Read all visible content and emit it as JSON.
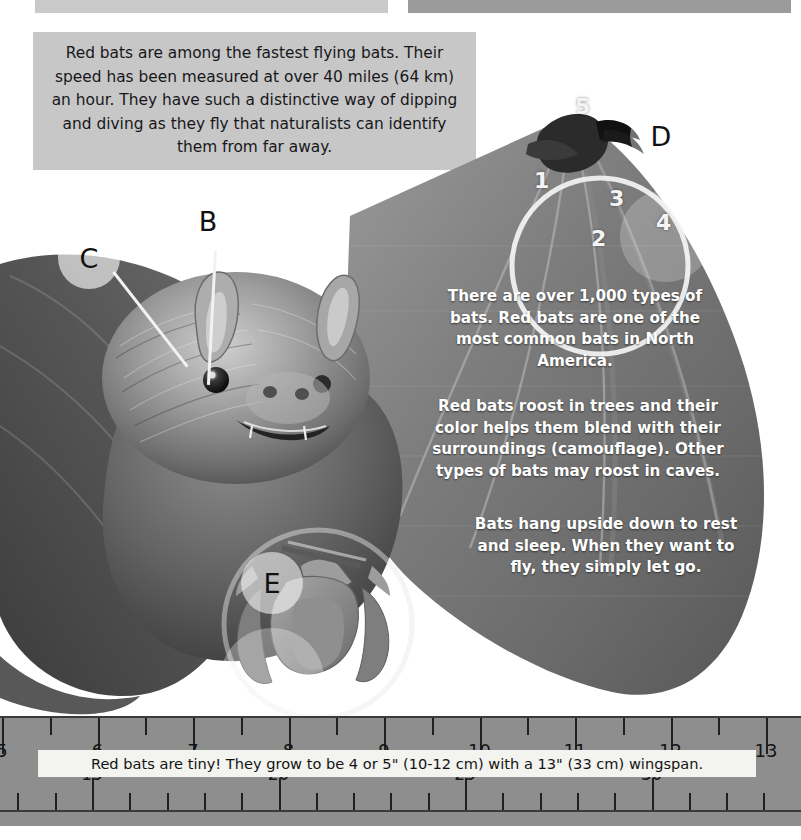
{
  "page": {
    "background_color": "#ffffff",
    "width": 801,
    "height": 840
  },
  "top_bars": {
    "left_color": "#c9c9c9",
    "right_color": "#9b9b9b"
  },
  "info_box": {
    "background_color": "#c7c7c7",
    "text": "Red bats are among the fastest flying bats. Their speed has been measured at over 40 miles (64 km) an hour. They have such a distinctive way of dipping and diving as they fly that naturalists can identify them from far away."
  },
  "callouts": [
    {
      "label": "B",
      "target": "eye"
    },
    {
      "label": "C",
      "target": "ear"
    },
    {
      "label": "D",
      "target": "wing-digits"
    },
    {
      "label": "E",
      "target": "hanging-bat"
    }
  ],
  "wing_digits": [
    "1",
    "2",
    "3",
    "4",
    "5"
  ],
  "wing_text_blocks": [
    "There are over 1,000 types of bats. Red bats are one of the most common bats in North America.",
    "Red bats roost in trees and their color helps them blend with their surroundings (camouflage). Other types of bats may roost in caves.",
    "Bats hang upside down to rest and sleep. When they want to fly, they simply let go."
  ],
  "ruler": {
    "background_color": "#8e8e8e",
    "inch_labels": [
      "5",
      "6",
      "7",
      "8",
      "9",
      "10",
      "11",
      "12",
      "13"
    ],
    "cm_labels": [
      "15",
      "20",
      "25",
      "30"
    ],
    "caption": "Red bats are tiny! They grow to be 4 or 5\" (10-12 cm) with a 13\" (33 cm) wingspan.",
    "caption_background": "#f3f3f0"
  }
}
